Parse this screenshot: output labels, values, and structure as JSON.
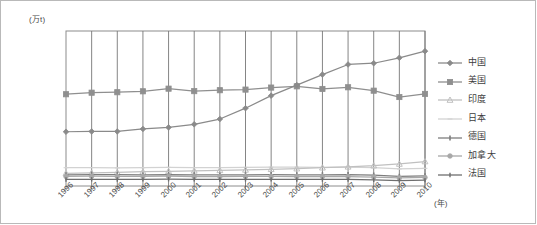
{
  "chart_data": {
    "type": "line",
    "title": "",
    "subtitle": "",
    "xlabel": "(年)",
    "ylabel": "(万t)",
    "ylim": [
      0,
      1000000
    ],
    "ytick_step": 100000,
    "yticks": [
      "1000000",
      "900000",
      "800000",
      "700000",
      "600000",
      "500000",
      "400000",
      "300000",
      "200000",
      "100000",
      "0"
    ],
    "grid": "vertical",
    "legend_position": "right",
    "categories": [
      "1996",
      "1997",
      "1998",
      "1999",
      "2000",
      "2001",
      "2002",
      "2003",
      "2004",
      "2005",
      "2006",
      "2007",
      "2008",
      "2009",
      "2010"
    ],
    "series": [
      {
        "name": "中国",
        "marker": "diamond",
        "color": "#8a8a8a",
        "values": [
          350000,
          352000,
          352000,
          368000,
          378000,
          398000,
          432000,
          502000,
          583000,
          651000,
          719000,
          784000,
          792000,
          827000,
          870000
        ]
      },
      {
        "name": "美国",
        "marker": "square",
        "color": "#8f8f8f",
        "values": [
          592000,
          602000,
          605000,
          611000,
          628000,
          612000,
          618000,
          622000,
          635000,
          643000,
          626000,
          637000,
          615000,
          574000,
          594000
        ]
      },
      {
        "name": "印度",
        "marker": "triangle",
        "color": "#c0c0c0",
        "values": [
          82000,
          85000,
          88000,
          92000,
          95000,
          98000,
          101000,
          104000,
          108000,
          112000,
          118000,
          124000,
          131000,
          142000,
          158000
        ]
      },
      {
        "name": "日本",
        "marker": "line-thin",
        "color": "#d2d2d2",
        "values": [
          118000,
          119000,
          117000,
          118000,
          120000,
          119000,
          119000,
          120000,
          121000,
          121000,
          120000,
          121000,
          119000,
          110000,
          114000
        ]
      },
      {
        "name": "德国",
        "marker": "dash",
        "color": "#7d7d7d",
        "values": [
          72000,
          74000,
          73000,
          71000,
          74000,
          72000,
          71000,
          72000,
          73000,
          72000,
          72000,
          73000,
          70000,
          62000,
          66000
        ]
      },
      {
        "name": "加拿大",
        "marker": "circle",
        "color": "#a8a8a8",
        "values": [
          62000,
          63000,
          62000,
          62000,
          63000,
          61000,
          61000,
          62000,
          62000,
          61000,
          61000,
          61000,
          58000,
          52000,
          55000
        ]
      },
      {
        "name": "法国",
        "marker": "line-bold",
        "color": "#6e6e6e",
        "values": [
          42000,
          43000,
          42000,
          43000,
          44000,
          43000,
          42000,
          43000,
          43000,
          42000,
          42000,
          42000,
          40000,
          35000,
          38000
        ]
      }
    ]
  },
  "legend": {
    "items": [
      {
        "label": "中国"
      },
      {
        "label": "美国"
      },
      {
        "label": "印度"
      },
      {
        "label": "日本"
      },
      {
        "label": "德国"
      },
      {
        "label": "加拿大"
      },
      {
        "label": "法国"
      }
    ]
  },
  "axes": {
    "y_unit_label": "(万t)",
    "x_unit_label": "(年)"
  }
}
